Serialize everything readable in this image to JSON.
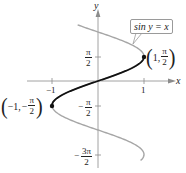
{
  "chart_data": {
    "type": "line",
    "title": "",
    "xlabel": "x",
    "ylabel": "y",
    "equation_label": "sin y = x",
    "xlim": [
      -2.1,
      2.0
    ],
    "ylim": [
      -5.2,
      3.7
    ],
    "grid": false,
    "x_ticks": [
      {
        "value": -1,
        "label": "-1"
      },
      {
        "value": 1,
        "label": "1"
      }
    ],
    "y_ticks": [
      {
        "value": 1.5708,
        "label": "π/2"
      },
      {
        "value": -1.5708,
        "label": "-π/2"
      },
      {
        "value": -4.7124,
        "label": "-3π/2"
      }
    ],
    "series": [
      {
        "name": "sin y = x (full relation)",
        "color": "#a6a6a6",
        "description": "x = sin y for y from about -5.1 to 3.6",
        "y_range": [
          -5.1,
          3.6
        ]
      },
      {
        "name": "y = arcsin x (principal branch)",
        "color": "#111111",
        "description": "x = sin y for y in [-π/2, π/2]",
        "y_range": [
          -1.5708,
          1.5708
        ]
      }
    ],
    "points": [
      {
        "x": 1,
        "y": 1.5708,
        "label": "(1, π/2)"
      },
      {
        "x": -1,
        "y": -1.5708,
        "label": "(-1, -π/2)"
      }
    ]
  },
  "labels": {
    "x_axis": "x",
    "y_axis": "y",
    "callout": "sin y = x",
    "tick_x_neg1": "−1",
    "tick_x_1": "1",
    "tick_y_pi2": {
      "num": "π",
      "den": "2",
      "sign": ""
    },
    "tick_y_negpi2": {
      "num": "π",
      "den": "2",
      "sign": "−"
    },
    "tick_y_neg3pi2": {
      "num": "3π",
      "den": "2",
      "sign": "−"
    },
    "point_upper": {
      "x": "1,",
      "num": "π",
      "den": "2",
      "sign": ""
    },
    "point_lower": {
      "x": "−1,",
      "num": "π",
      "den": "2",
      "sign": "−"
    }
  }
}
